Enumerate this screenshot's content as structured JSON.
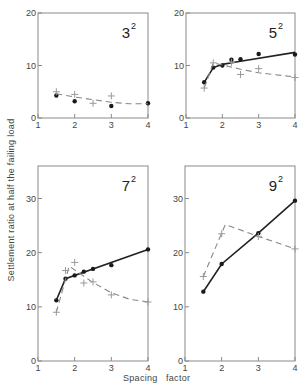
{
  "chart_data": [
    {
      "type": "line",
      "title": "3²",
      "panel_label": {
        "base": "3",
        "exp": "2"
      },
      "xlabel": "Spacing factor",
      "ylabel": "Settlement ratio at half the failing load",
      "xlim": [
        1,
        4
      ],
      "ylim": [
        0,
        20
      ],
      "xticks": [
        "1",
        "2",
        "3",
        "4"
      ],
      "yticks": [
        "0",
        "10",
        "20"
      ],
      "series": [
        {
          "name": "measured (dots)",
          "marker": "dot",
          "line": "none",
          "x": [
            1.5,
            2.0,
            3.0,
            4.0
          ],
          "y": [
            4.3,
            3.2,
            2.3,
            2.8
          ]
        },
        {
          "name": "measured (crosses)",
          "marker": "cross",
          "line": "none",
          "x": [
            1.5,
            2.0,
            2.5,
            3.0
          ],
          "y": [
            5.0,
            4.5,
            2.8,
            4.2
          ]
        },
        {
          "name": "trend (dashed)",
          "marker": "none",
          "line": "dashed",
          "x": [
            1.5,
            2.0,
            2.5,
            3.0,
            3.5,
            4.0
          ],
          "y": [
            4.6,
            4.0,
            3.5,
            3.0,
            2.7,
            2.7
          ]
        }
      ]
    },
    {
      "type": "line",
      "title": "5²",
      "panel_label": {
        "base": "5",
        "exp": "2"
      },
      "xlabel": "Spacing factor",
      "ylabel": "Settlement ratio at half the failing load",
      "xlim": [
        1,
        4
      ],
      "ylim": [
        0,
        20
      ],
      "xticks": [
        "1",
        "2",
        "3",
        "4"
      ],
      "yticks": [
        "0",
        "10",
        "20"
      ],
      "series": [
        {
          "name": "dots (solid)",
          "marker": "dot",
          "line": "solid",
          "x": [
            1.5,
            1.75,
            2.0,
            2.25,
            2.5,
            3.0,
            4.0
          ],
          "y": [
            6.8,
            9.6,
            10.0,
            11.1,
            11.2,
            12.2,
            12.1
          ],
          "line_x": [
            1.5,
            1.75,
            2.0,
            2.5,
            4.0
          ],
          "line_y": [
            6.8,
            9.6,
            10.2,
            10.8,
            12.5
          ]
        },
        {
          "name": "crosses (dashed)",
          "marker": "cross",
          "line": "dashed",
          "x": [
            1.5,
            1.75,
            2.25,
            2.5,
            3.0,
            4.0
          ],
          "y": [
            5.7,
            10.5,
            10.6,
            8.3,
            9.4,
            7.7
          ],
          "line_x": [
            1.5,
            1.75,
            2.5,
            3.0,
            4.0
          ],
          "line_y": [
            5.7,
            10.5,
            9.3,
            8.6,
            7.8
          ]
        }
      ]
    },
    {
      "type": "line",
      "title": "7²",
      "panel_label": {
        "base": "7",
        "exp": "2"
      },
      "xlabel": "Spacing factor",
      "ylabel": "Settlement ratio at half the failing load",
      "xlim": [
        1,
        4
      ],
      "ylim": [
        0,
        36
      ],
      "xticks": [
        "1",
        "2",
        "3",
        "4"
      ],
      "yticks": [
        "0",
        "10",
        "20",
        "30"
      ],
      "series": [
        {
          "name": "dots (solid)",
          "marker": "dot",
          "line": "solid",
          "x": [
            1.5,
            1.75,
            2.0,
            2.25,
            2.5,
            3.0,
            4.0
          ],
          "y": [
            11.2,
            15.2,
            15.8,
            16.5,
            17.0,
            17.7,
            20.6
          ],
          "line_x": [
            1.5,
            1.75,
            4.0
          ],
          "line_y": [
            11.2,
            15.2,
            20.6
          ]
        },
        {
          "name": "crosses (dashed)",
          "marker": "cross",
          "line": "dashed",
          "x": [
            1.5,
            1.75,
            2.0,
            2.25,
            2.5,
            3.0,
            4.0
          ],
          "y": [
            9.0,
            16.7,
            18.2,
            14.4,
            14.6,
            12.2,
            10.9
          ],
          "line_x": [
            1.5,
            1.85,
            2.5,
            3.0,
            3.5,
            4.0
          ],
          "line_y": [
            9.0,
            17.5,
            14.5,
            12.6,
            11.4,
            10.9
          ]
        }
      ]
    },
    {
      "type": "line",
      "title": "9²",
      "panel_label": {
        "base": "9",
        "exp": "2"
      },
      "xlabel": "Spacing factor",
      "ylabel": "Settlement ratio at half the failing load",
      "xlim": [
        1,
        4
      ],
      "ylim": [
        0,
        36
      ],
      "xticks": [
        "1",
        "2",
        "3",
        "4"
      ],
      "yticks": [
        "0",
        "10",
        "20",
        "30"
      ],
      "series": [
        {
          "name": "dots (solid)",
          "marker": "dot",
          "line": "solid",
          "x": [
            1.5,
            2.0,
            3.0,
            4.0
          ],
          "y": [
            12.8,
            17.9,
            23.6,
            29.6
          ],
          "line_x": [
            1.5,
            2.0,
            3.0,
            4.0
          ],
          "line_y": [
            12.8,
            17.9,
            23.6,
            29.6
          ]
        },
        {
          "name": "crosses (dashed)",
          "marker": "cross",
          "line": "dashed",
          "x": [
            1.5,
            2.0,
            3.0,
            4.0
          ],
          "y": [
            15.6,
            23.5,
            23.0,
            20.7
          ],
          "line_x": [
            1.5,
            2.1,
            3.0,
            4.0
          ],
          "line_y": [
            15.6,
            25.2,
            23.0,
            20.7
          ]
        }
      ]
    }
  ],
  "labels": {
    "ylabel": "Settlement ratio at half the failing load",
    "xlabel_left": "Spacing",
    "xlabel_right": "factor"
  },
  "colors": {
    "axis": "#8a8a8a",
    "solid_line": "#222222",
    "dashed_line": "#888888",
    "dot": "#1a1a1a",
    "cross": "#999999"
  }
}
